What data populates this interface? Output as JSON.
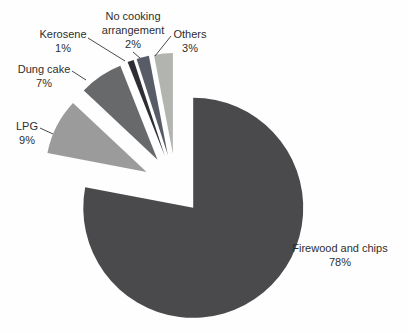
{
  "chart_data": {
    "type": "pie",
    "title": "",
    "legend": "none",
    "exploded": true,
    "direction": "clockwise",
    "start_angle_deg": 0,
    "categories": [
      "Firewood and chips",
      "LPG",
      "Dung cake",
      "Kerosene",
      "No cooking arrangement",
      "Others"
    ],
    "values": [
      78,
      9,
      7,
      1,
      2,
      3
    ],
    "slices": [
      {
        "label": "Firewood and chips",
        "pct": 78,
        "pct_text": "78%",
        "color": "#4a4a4c"
      },
      {
        "label": "LPG",
        "pct": 9,
        "pct_text": "9%",
        "color": "#9b9b9b"
      },
      {
        "label": "Dung cake",
        "pct": 7,
        "pct_text": "7%",
        "color": "#68696b"
      },
      {
        "label": "Kerosene",
        "pct": 1,
        "pct_text": "1%",
        "color": "#2d2e34"
      },
      {
        "label": "No cooking arrangement",
        "pct": 2,
        "pct_text": "2%",
        "color": "#575c66"
      },
      {
        "label": "Others",
        "pct": 3,
        "pct_text": "3%",
        "color": "#b2b5af"
      }
    ],
    "data_labels": "category name and percent shown outside slices with leader lines"
  }
}
